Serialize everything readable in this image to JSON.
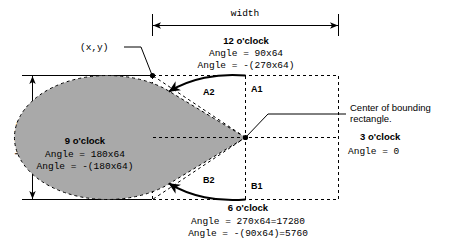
{
  "figure": {
    "title_semantic": "gdi-arc-pie-angle-reference",
    "colors": {
      "fill_gray": "#a9a9a9",
      "stroke_black": "#000000",
      "background": "#ffffff"
    },
    "dimensions": {
      "width_label": "width",
      "height_label": "height"
    },
    "origin_label": "(x,y)",
    "center_callout": {
      "line1": "Center of bounding",
      "line2": "rectangle."
    },
    "clock_labels": {
      "twelve": {
        "title": "12 o'clock",
        "line1": "Angle = 90x64",
        "line2": "Angle = -(270x64)"
      },
      "three": {
        "title": "3 o'clock",
        "line1": "Angle = 0"
      },
      "six": {
        "title": "6 o'clock",
        "line1": "Angle = 270x64=17280",
        "line2": "Angle = -(90x64)=5760"
      },
      "nine": {
        "title": "9 o'clock",
        "line1": "Angle = 180x64",
        "line2": "Angle = -(180x64)"
      }
    },
    "quadrants": {
      "a1": "A1",
      "a2": "A2",
      "b1": "B1",
      "b2": "B2"
    }
  }
}
